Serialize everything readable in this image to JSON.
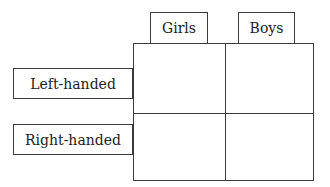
{
  "columns": [
    {
      "label": "Girls"
    },
    {
      "label": "Boys"
    }
  ],
  "rows": [
    {
      "label": "Left-handed"
    },
    {
      "label": "Right-handed"
    }
  ],
  "cells": [
    [
      "",
      ""
    ],
    [
      "",
      ""
    ]
  ]
}
